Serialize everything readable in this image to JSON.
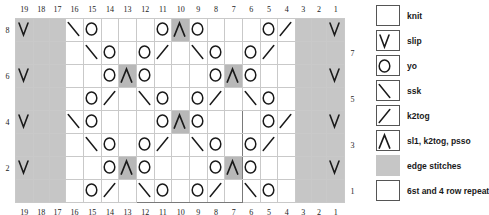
{
  "chart_data": {
    "type": "table",
    "column_numbers_top": [
      19,
      18,
      17,
      16,
      15,
      14,
      13,
      12,
      11,
      10,
      9,
      8,
      7,
      6,
      5,
      4,
      3,
      2,
      1
    ],
    "column_numbers_bottom": [
      19,
      18,
      17,
      16,
      15,
      14,
      13,
      12,
      11,
      10,
      9,
      8,
      7,
      6,
      5,
      4,
      3,
      2,
      1
    ],
    "row_numbers_left": [
      8,
      "",
      6,
      "",
      4,
      "",
      2,
      ""
    ],
    "row_numbers_right": [
      "",
      7,
      "",
      5,
      "",
      3,
      "",
      1
    ],
    "rows": [
      {
        "num_left": "8",
        "num_right": "",
        "cells": [
          "slip",
          "edge",
          "edge",
          "ssk",
          "yo",
          "knit",
          "knit",
          "knit",
          "yo",
          "psso",
          "yo",
          "knit",
          "knit",
          "knit",
          "yo",
          "k2tog",
          "edge",
          "edge",
          "slip"
        ]
      },
      {
        "num_left": "",
        "num_right": "7",
        "cells": [
          "edge",
          "edge",
          "edge",
          "knit",
          "ssk",
          "yo",
          "knit",
          "yo",
          "k2tog",
          "knit",
          "ssk",
          "yo",
          "knit",
          "yo",
          "k2tog",
          "knit",
          "edge",
          "edge",
          "edge"
        ]
      },
      {
        "num_left": "6",
        "num_right": "",
        "cells": [
          "slip",
          "edge",
          "edge",
          "knit",
          "knit",
          "yo",
          "psso",
          "yo",
          "knit",
          "knit",
          "knit",
          "yo",
          "psso",
          "yo",
          "knit",
          "knit",
          "edge",
          "edge",
          "slip"
        ]
      },
      {
        "num_left": "",
        "num_right": "5",
        "cells": [
          "edge",
          "edge",
          "edge",
          "knit",
          "yo",
          "k2tog",
          "knit",
          "ssk",
          "yo",
          "knit",
          "yo",
          "k2tog",
          "knit",
          "ssk",
          "yo",
          "knit",
          "edge",
          "edge",
          "edge"
        ]
      },
      {
        "num_left": "4",
        "num_right": "",
        "cells": [
          "slip",
          "edge",
          "edge",
          "ssk",
          "yo",
          "knit",
          "knit",
          "knit",
          "yo",
          "psso",
          "yo",
          "knit",
          "knit",
          "knit",
          "yo",
          "k2tog",
          "edge",
          "edge",
          "slip"
        ]
      },
      {
        "num_left": "",
        "num_right": "3",
        "cells": [
          "edge",
          "edge",
          "edge",
          "knit",
          "ssk",
          "yo",
          "knit",
          "yo",
          "k2tog",
          "knit",
          "ssk",
          "yo",
          "knit",
          "yo",
          "k2tog",
          "knit",
          "edge",
          "edge",
          "edge"
        ]
      },
      {
        "num_left": "2",
        "num_right": "",
        "cells": [
          "slip",
          "edge",
          "edge",
          "knit",
          "knit",
          "yo",
          "psso",
          "yo",
          "knit",
          "knit",
          "knit",
          "yo",
          "psso",
          "yo",
          "knit",
          "knit",
          "edge",
          "edge",
          "slip"
        ]
      },
      {
        "num_left": "",
        "num_right": "1",
        "cells": [
          "edge",
          "edge",
          "edge",
          "knit",
          "yo",
          "k2tog",
          "knit",
          "ssk",
          "yo",
          "knit",
          "yo",
          "k2tog",
          "knit",
          "ssk",
          "yo",
          "knit",
          "edge",
          "edge",
          "edge"
        ]
      }
    ],
    "repeat_box": {
      "columns": [
        12,
        11,
        10,
        9,
        8,
        7
      ],
      "rows": [
        4,
        3,
        2,
        1
      ],
      "label": "6st and 4 row repeat"
    },
    "edge_columns": [
      19,
      18,
      17,
      3,
      2,
      1
    ]
  },
  "legend": {
    "items": [
      {
        "symbol": "knit",
        "label": "knit"
      },
      {
        "symbol": "slip",
        "label": "slip"
      },
      {
        "symbol": "yo",
        "label": "yo"
      },
      {
        "symbol": "ssk",
        "label": "ssk"
      },
      {
        "symbol": "k2tog",
        "label": "k2tog"
      },
      {
        "symbol": "psso",
        "label": "sl1, k2tog, psso"
      },
      {
        "symbol": "edge",
        "label": "edge stitches"
      },
      {
        "symbol": "repeat",
        "label": "6st and 4 row repeat"
      }
    ]
  },
  "colors": {
    "edge_fill": "#c6c6c6",
    "shade_fill": "#b8b8b8",
    "grid_line": "#c9c9c9",
    "repeat_outline": "#7a7a7a",
    "symbol_stroke": "#1a1a1a"
  }
}
